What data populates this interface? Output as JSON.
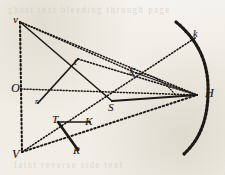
{
  "figure": {
    "background_color": "#f3f1ec",
    "ink_color": "#1c1a17",
    "bleed_color": "#cfc8ba",
    "width": 225,
    "height": 175,
    "bleedthrough": {
      "top_text": "ghost text bleeding through page",
      "bottom_text": "faint reverse side text"
    },
    "points": [
      {
        "id": "v",
        "label": "v",
        "x": 20,
        "y": 22,
        "label_x": 13,
        "label_y": 14,
        "size": 11
      },
      {
        "id": "O",
        "label": "O",
        "x": 21,
        "y": 89,
        "label_x": 11,
        "label_y": 82,
        "size": 12
      },
      {
        "id": "V",
        "label": "V",
        "x": 22,
        "y": 152,
        "label_x": 12,
        "label_y": 148,
        "size": 12
      },
      {
        "id": "t",
        "label": "t",
        "x": 78,
        "y": 59,
        "label_x": 74,
        "label_y": 57,
        "size": 10
      },
      {
        "id": "r",
        "label": "r",
        "x": 38,
        "y": 103,
        "label_x": 35,
        "label_y": 98,
        "size": 8
      },
      {
        "id": "X",
        "label": "X",
        "x": 136,
        "y": 73,
        "label_x": 128,
        "label_y": 66,
        "size": 11
      },
      {
        "id": "S",
        "label": "S",
        "x": 112,
        "y": 101,
        "label_x": 108,
        "label_y": 102,
        "size": 11
      },
      {
        "id": "H",
        "label": "H",
        "x": 197,
        "y": 95,
        "label_x": 205,
        "label_y": 87,
        "size": 12
      },
      {
        "id": "k",
        "label": "k",
        "x": 195,
        "y": 38,
        "label_x": 193,
        "label_y": 29,
        "size": 10
      },
      {
        "id": "T",
        "label": "T",
        "x": 58,
        "y": 122,
        "label_x": 52,
        "label_y": 114,
        "size": 11
      },
      {
        "id": "K",
        "label": "K",
        "x": 90,
        "y": 122,
        "label_x": 85,
        "label_y": 116,
        "size": 11
      },
      {
        "id": "R",
        "label": "R",
        "x": 78,
        "y": 150,
        "label_x": 73,
        "label_y": 145,
        "size": 11
      }
    ],
    "segments": [
      {
        "id": "axis-v-V",
        "from": "v",
        "to": "V",
        "style": "dotted",
        "weight": 2.1
      },
      {
        "id": "v-to-X",
        "from": "v",
        "to": "X",
        "style": "dotted",
        "weight": 1.5
      },
      {
        "id": "v-to-H",
        "from": "v",
        "to": "H",
        "style": "dotted",
        "weight": 1.5
      },
      {
        "id": "v-to-S",
        "from": "v",
        "to": "S",
        "style": "solid",
        "weight": 1.5
      },
      {
        "id": "t-to-r",
        "from": "t",
        "to": "r",
        "style": "solid",
        "weight": 1.7
      },
      {
        "id": "t-to-H",
        "from": "t",
        "to": "H",
        "style": "dotted",
        "weight": 1.6
      },
      {
        "id": "O-to-H",
        "from": "O",
        "to": "H",
        "style": "dotted",
        "weight": 1.5
      },
      {
        "id": "S-to-H",
        "from": "S",
        "to": "H",
        "style": "solid",
        "weight": 2.0
      },
      {
        "id": "X-to-H",
        "from": "X",
        "to": "H",
        "style": "solid",
        "weight": 1.3
      },
      {
        "id": "V-to-H",
        "from": "V",
        "to": "H",
        "style": "dotted",
        "weight": 2.0
      },
      {
        "id": "V-to-k",
        "from": "V",
        "to": "k",
        "style": "dotted",
        "weight": 1.6
      },
      {
        "id": "T-to-K",
        "from": "T",
        "to": "K",
        "style": "solid",
        "weight": 1.4
      },
      {
        "id": "thick-T-R",
        "from": "T",
        "to": "R",
        "style": "solid",
        "weight": 2.6
      }
    ],
    "arcs": [
      {
        "id": "mirror-arc",
        "style": "dashed-thick",
        "weight": 3.2,
        "path": "M 176 22 C 203 44, 209 70, 208 95 C 207 122, 199 140, 184 154"
      },
      {
        "id": "arc-inner",
        "style": "dotted-thin",
        "weight": 1.2,
        "path": "M 136 73 C 152 74, 166 82, 176 96"
      }
    ]
  }
}
